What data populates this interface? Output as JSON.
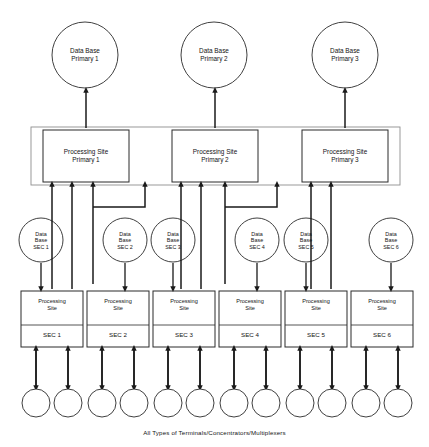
{
  "diagram": {
    "caption": "All Types of Terminals/Concentrators/Multiplexers",
    "colors": {
      "line": "#1a1a1a",
      "fill": "#ffffff",
      "text": "#141414"
    },
    "primary_databases": [
      {
        "label": "Data Base\nPrimary 1",
        "cx": 85,
        "cy": 55,
        "r": 33
      },
      {
        "label": "Data Base\nPrimary 2",
        "cx": 214,
        "cy": 55,
        "r": 33
      },
      {
        "label": "Data Base\nPrimary 3",
        "cx": 345,
        "cy": 55,
        "r": 33
      }
    ],
    "primary_sites": [
      {
        "label": "Processing Site\nPrimary 1",
        "x": 43,
        "y": 130,
        "w": 86,
        "h": 52
      },
      {
        "label": "Processing Site\nPrimary 2",
        "x": 172,
        "y": 130,
        "w": 86,
        "h": 52
      },
      {
        "label": "Processing Site\nPrimary 3",
        "x": 302,
        "y": 130,
        "w": 86,
        "h": 52
      }
    ],
    "primary_band": {
      "x": 31,
      "y": 127,
      "w": 369,
      "h": 58
    },
    "secondary_databases": [
      {
        "label": "Data\nBase\nSEC 1",
        "cx": 41,
        "cy": 240,
        "r": 22
      },
      {
        "label": "Data\nBase\nSEC 2",
        "cx": 125,
        "cy": 240,
        "r": 22
      },
      {
        "label": "Data\nBase\nSEC 3",
        "cx": 173,
        "cy": 240,
        "r": 22
      },
      {
        "label": "Data\nBase\nSEC 4",
        "cx": 257,
        "cy": 240,
        "r": 22
      },
      {
        "label": "Data\nBase\nSEC 5",
        "cx": 306,
        "cy": 240,
        "r": 22
      },
      {
        "label": "Data\nBase\nSEC 6",
        "cx": 391,
        "cy": 240,
        "r": 22
      }
    ],
    "secondary_sites": [
      {
        "top": "Processing\nSite",
        "bottom": "SEC 1",
        "x": 21,
        "y": 291,
        "w": 62,
        "h": 56
      },
      {
        "top": "Processing\nSite",
        "bottom": "SEC 2",
        "x": 87,
        "y": 291,
        "w": 62,
        "h": 56
      },
      {
        "top": "Processing\nSite",
        "bottom": "SEC 3",
        "x": 153,
        "y": 291,
        "w": 62,
        "h": 56
      },
      {
        "top": "Processing\nSite",
        "bottom": "SEC 4",
        "x": 219,
        "y": 291,
        "w": 62,
        "h": 56
      },
      {
        "top": "Processing\nSite",
        "bottom": "SEC 5",
        "x": 285,
        "y": 291,
        "w": 62,
        "h": 56
      },
      {
        "top": "Processing\nSite",
        "bottom": "SEC 6",
        "x": 351,
        "y": 291,
        "w": 62,
        "h": 56
      }
    ],
    "terminals": [
      {
        "cx": 36,
        "cy": 403,
        "r": 14
      },
      {
        "cx": 68,
        "cy": 403,
        "r": 14
      },
      {
        "cx": 102,
        "cy": 403,
        "r": 14
      },
      {
        "cx": 134,
        "cy": 403,
        "r": 14
      },
      {
        "cx": 168,
        "cy": 403,
        "r": 14
      },
      {
        "cx": 200,
        "cy": 403,
        "r": 14
      },
      {
        "cx": 234,
        "cy": 403,
        "r": 14
      },
      {
        "cx": 266,
        "cy": 403,
        "r": 14
      },
      {
        "cx": 300,
        "cy": 403,
        "r": 14
      },
      {
        "cx": 332,
        "cy": 403,
        "r": 14
      },
      {
        "cx": 366,
        "cy": 403,
        "r": 14
      },
      {
        "cx": 398,
        "cy": 403,
        "r": 14
      }
    ]
  }
}
